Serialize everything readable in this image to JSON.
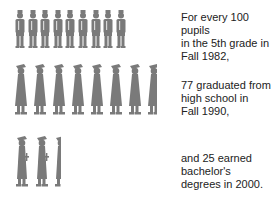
{
  "figure_color": "#7a7a7a",
  "rows": [
    {
      "name": "pupils",
      "count": 9,
      "icon": "schoolchild-icon",
      "caption_lines": [
        "For every 100 pupils",
        "in the 5th grade in",
        "Fall 1982,"
      ]
    },
    {
      "name": "high-school-graduates",
      "count": 7.7,
      "icon": "graduate-gown-icon",
      "caption_lines": [
        "77 graduated from",
        "high school in",
        "Fall 1990,"
      ]
    },
    {
      "name": "bachelor-degree-earners",
      "count": 2.5,
      "icon": "diploma-graduate-icon",
      "caption_lines": [
        "and 25 earned",
        "bachelor's",
        "degrees in 2000."
      ]
    }
  ]
}
